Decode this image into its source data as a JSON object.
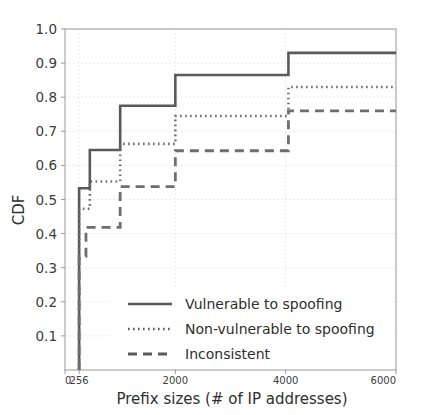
{
  "chart_data": {
    "type": "line",
    "title": "",
    "xlabel": "Prefix sizes (# of IP addresses)",
    "ylabel": "CDF",
    "xlim": [
      0,
      6000
    ],
    "ylim": [
      0,
      1.0
    ],
    "grid": true,
    "legend_position": "lower center",
    "xticks": [
      0,
      256,
      2000,
      4000,
      6000
    ],
    "xtick_labels": [
      "0",
      "256",
      "2000",
      "4000",
      "6000"
    ],
    "yticks": [
      0.1,
      0.2,
      0.3,
      0.4,
      0.5,
      0.6,
      0.7,
      0.8,
      0.9,
      1.0
    ],
    "ytick_labels": [
      "0.1",
      "0.2",
      "0.3",
      "0.4",
      "0.5",
      "0.6",
      "0.7",
      "0.8",
      "0.9",
      "1.0"
    ],
    "series": [
      {
        "name": "Vulnerable to spoofing",
        "style": "solid",
        "color": "#5a5a5a",
        "x": [
          256,
          256,
          450,
          450,
          1000,
          1000,
          2000,
          2000,
          4050,
          4050,
          6000
        ],
        "y": [
          0.0,
          0.533,
          0.533,
          0.645,
          0.645,
          0.775,
          0.775,
          0.865,
          0.865,
          0.93,
          0.93
        ]
      },
      {
        "name": "Non-vulnerable to spoofing",
        "style": "dotted",
        "color": "#6e6e6e",
        "x": [
          256,
          256,
          450,
          450,
          1000,
          1000,
          2000,
          2000,
          4050,
          4050,
          6000
        ],
        "y": [
          0.0,
          0.473,
          0.473,
          0.553,
          0.553,
          0.663,
          0.663,
          0.745,
          0.745,
          0.83,
          0.83
        ]
      },
      {
        "name": "Inconsistent",
        "style": "dashed",
        "color": "#6e6e6e",
        "x": [
          256,
          256,
          380,
          380,
          620,
          620,
          1000,
          1000,
          2000,
          2000,
          4050,
          4050,
          6000
        ],
        "y": [
          0.0,
          0.333,
          0.333,
          0.418,
          0.418,
          0.418,
          0.418,
          0.538,
          0.538,
          0.643,
          0.643,
          0.76,
          0.76
        ]
      }
    ],
    "legend": [
      {
        "label": "Vulnerable to spoofing",
        "style": "solid"
      },
      {
        "label": "Non-vulnerable to spoofing",
        "style": "dotted"
      },
      {
        "label": "Inconsistent",
        "style": "dashed"
      }
    ],
    "colors": {
      "line": "#5a5a5a",
      "grid": "#dcdcdc",
      "axis": "#9a9a9a",
      "text": "#2e2e2e",
      "background": "#ffffff"
    }
  }
}
